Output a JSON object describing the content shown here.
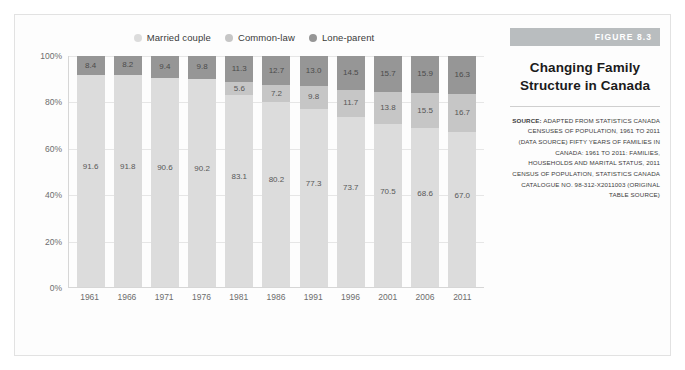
{
  "figure": {
    "banner_label": "FIGURE 8.3",
    "title_line1": "Changing Family",
    "title_line2": "Structure in Canada",
    "source_label": "SOURCE:",
    "source_text": " ADAPTED FROM STATISTICS CANADA CENSUSES OF POPULATION, 1961 TO 2011 (DATA SOURCE) FIFTY YEARS OF FAMILIES IN CANADA: 1961 TO 2011: FAMILIES, HOUSEHOLDS AND MARITAL STATUS, 2011 CENSUS OF POPULATION, STATISTICS CANADA CATALOGUE NO. 98-312-X2011003 (ORIGINAL TABLE SOURCE)"
  },
  "colors": {
    "married": "#dcdcdc",
    "common_law": "#c6c6c6",
    "lone_parent": "#969696",
    "banner": "#b9bdbf",
    "gridline": "#e6e6e6",
    "axis": "#d6d6d6"
  },
  "chart_data": {
    "type": "bar",
    "stacked": true,
    "stack_mode": "percent",
    "title": "Changing Family Structure in Canada",
    "xlabel": "",
    "ylabel": "",
    "ylim": [
      0,
      100
    ],
    "yticks": [
      "100%",
      "80%",
      "60%",
      "40%",
      "20%",
      "0%"
    ],
    "ytick_values": [
      100,
      80,
      60,
      40,
      20,
      0
    ],
    "grid": true,
    "legend_position": "top-center",
    "categories": [
      "1961",
      "1966",
      "1971",
      "1976",
      "1981",
      "1986",
      "1991",
      "1996",
      "2001",
      "2006",
      "2011"
    ],
    "series": [
      {
        "name": "Married couple",
        "color": "#dcdcdc",
        "values": [
          91.6,
          91.8,
          90.6,
          90.2,
          83.1,
          80.2,
          77.3,
          73.7,
          70.5,
          68.6,
          67.0
        ],
        "labels": [
          "91.6",
          "91.8",
          "90.6",
          "90.2",
          "83.1",
          "80.2",
          "77.3",
          "73.7",
          "70.5",
          "68.6",
          "67.0"
        ]
      },
      {
        "name": "Common-law",
        "color": "#c6c6c6",
        "values": [
          0,
          0,
          0,
          0,
          5.6,
          7.2,
          9.8,
          11.7,
          13.8,
          15.5,
          16.7
        ],
        "labels": [
          "",
          "",
          "",
          "",
          "5.6",
          "7.2",
          "9.8",
          "11.7",
          "13.8",
          "15.5",
          "16.7"
        ]
      },
      {
        "name": "Lone-parent",
        "color": "#969696",
        "values": [
          8.4,
          8.2,
          9.4,
          9.8,
          11.3,
          12.7,
          13.0,
          14.5,
          15.7,
          15.9,
          16.3
        ],
        "labels": [
          "8.4",
          "8.2",
          "9.4",
          "9.8",
          "11.3",
          "12.7",
          "13.0",
          "14.5",
          "15.7",
          "15.9",
          "16.3"
        ]
      }
    ]
  }
}
